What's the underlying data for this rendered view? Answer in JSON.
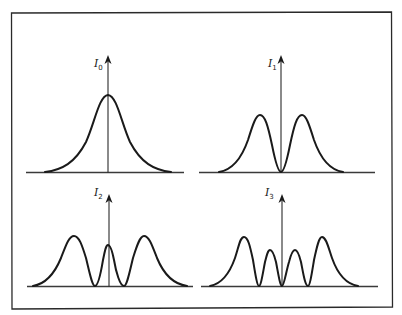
{
  "figure": {
    "frame_color": "#2a2a2a",
    "curve_color": "#1a1a1a",
    "panels": [
      {
        "id": "I0",
        "label_main": "I",
        "label_sub": "0",
        "shape": "single-peak",
        "origin": [
          108,
          172
        ],
        "baseline_x": [
          26,
          184
        ],
        "peaks": [
          {
            "x": 0,
            "h": 77,
            "w": 19
          }
        ],
        "zeros": []
      },
      {
        "id": "I1",
        "label_main": "I",
        "label_sub": "1",
        "shape": "two-peaks",
        "origin": [
          281,
          172
        ],
        "baseline_x": [
          199,
          375
        ],
        "peaks": [
          {
            "x": -21,
            "h": 57,
            "w": 10
          },
          {
            "x": 21,
            "h": 57,
            "w": 10
          }
        ],
        "zeros": [
          0
        ]
      },
      {
        "id": "I2",
        "label_main": "I",
        "label_sub": "2",
        "shape": "three-peaks",
        "origin": [
          109,
          286
        ],
        "baseline_x": [
          27,
          193
        ],
        "peaks": [
          {
            "x": -35,
            "h": 50,
            "w": 9
          },
          {
            "x": 0,
            "h": 41,
            "w": 5
          },
          {
            "x": 35,
            "h": 50,
            "w": 9
          }
        ],
        "zeros": [
          -14,
          15
        ]
      },
      {
        "id": "I3",
        "label_main": "I",
        "label_sub": "3",
        "shape": "four-peaks",
        "origin": [
          282,
          286
        ],
        "baseline_x": [
          201,
          378
        ],
        "peaks": [
          {
            "x": -39,
            "h": 49,
            "w": 8
          },
          {
            "x": -12,
            "h": 36,
            "w": 4.5
          },
          {
            "x": 13,
            "h": 36,
            "w": 4.5
          },
          {
            "x": 40,
            "h": 49,
            "w": 8
          }
        ],
        "zeros": [
          -23,
          0,
          26
        ]
      }
    ]
  }
}
